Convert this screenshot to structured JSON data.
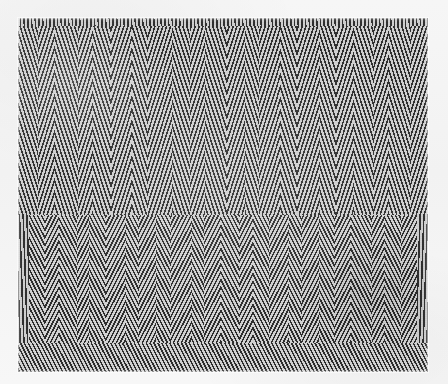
{
  "page": {
    "background_color": "#f4f4f4",
    "width": 448,
    "height": 384
  },
  "artwork": {
    "name": "zigzag-line-screen-plate",
    "description": "Diagonal halftone line screen forming alternating chevron bands",
    "plate_rect": {
      "x": 18,
      "y": 18,
      "width": 410,
      "height": 354
    },
    "colors": {
      "ink": "#2f2f2f",
      "paper": "#d2d2d2",
      "margin": "#f4f4f4"
    },
    "line_screen": {
      "period_px": 3.7,
      "ink_width_px": 1.55,
      "angle_a_deg": 72,
      "angle_b_deg": 108
    },
    "bands": [
      {
        "name": "upper-chevron-band",
        "y": 0,
        "height": 197,
        "cell_count": 22,
        "screen_angles": [
          72,
          108
        ],
        "note": "Tall V and inverted-V chevrons spanning the full band height"
      },
      {
        "name": "lower-chevron-band",
        "y": 197,
        "height": 128,
        "cell_count": 26,
        "screen_angles": [
          63,
          117
        ],
        "note": "Denser, steeper chevrons, shorter column cells"
      },
      {
        "name": "bottom-edge-strip",
        "y": 325,
        "height": 29,
        "cell_count": 1,
        "screen_angles": [
          63
        ],
        "note": "Uniform right-leaning screen running the full width"
      }
    ],
    "top_edge_strip": {
      "name": "top-edge-strip",
      "y": 0,
      "height": 8,
      "screen_angle": 88
    }
  }
}
